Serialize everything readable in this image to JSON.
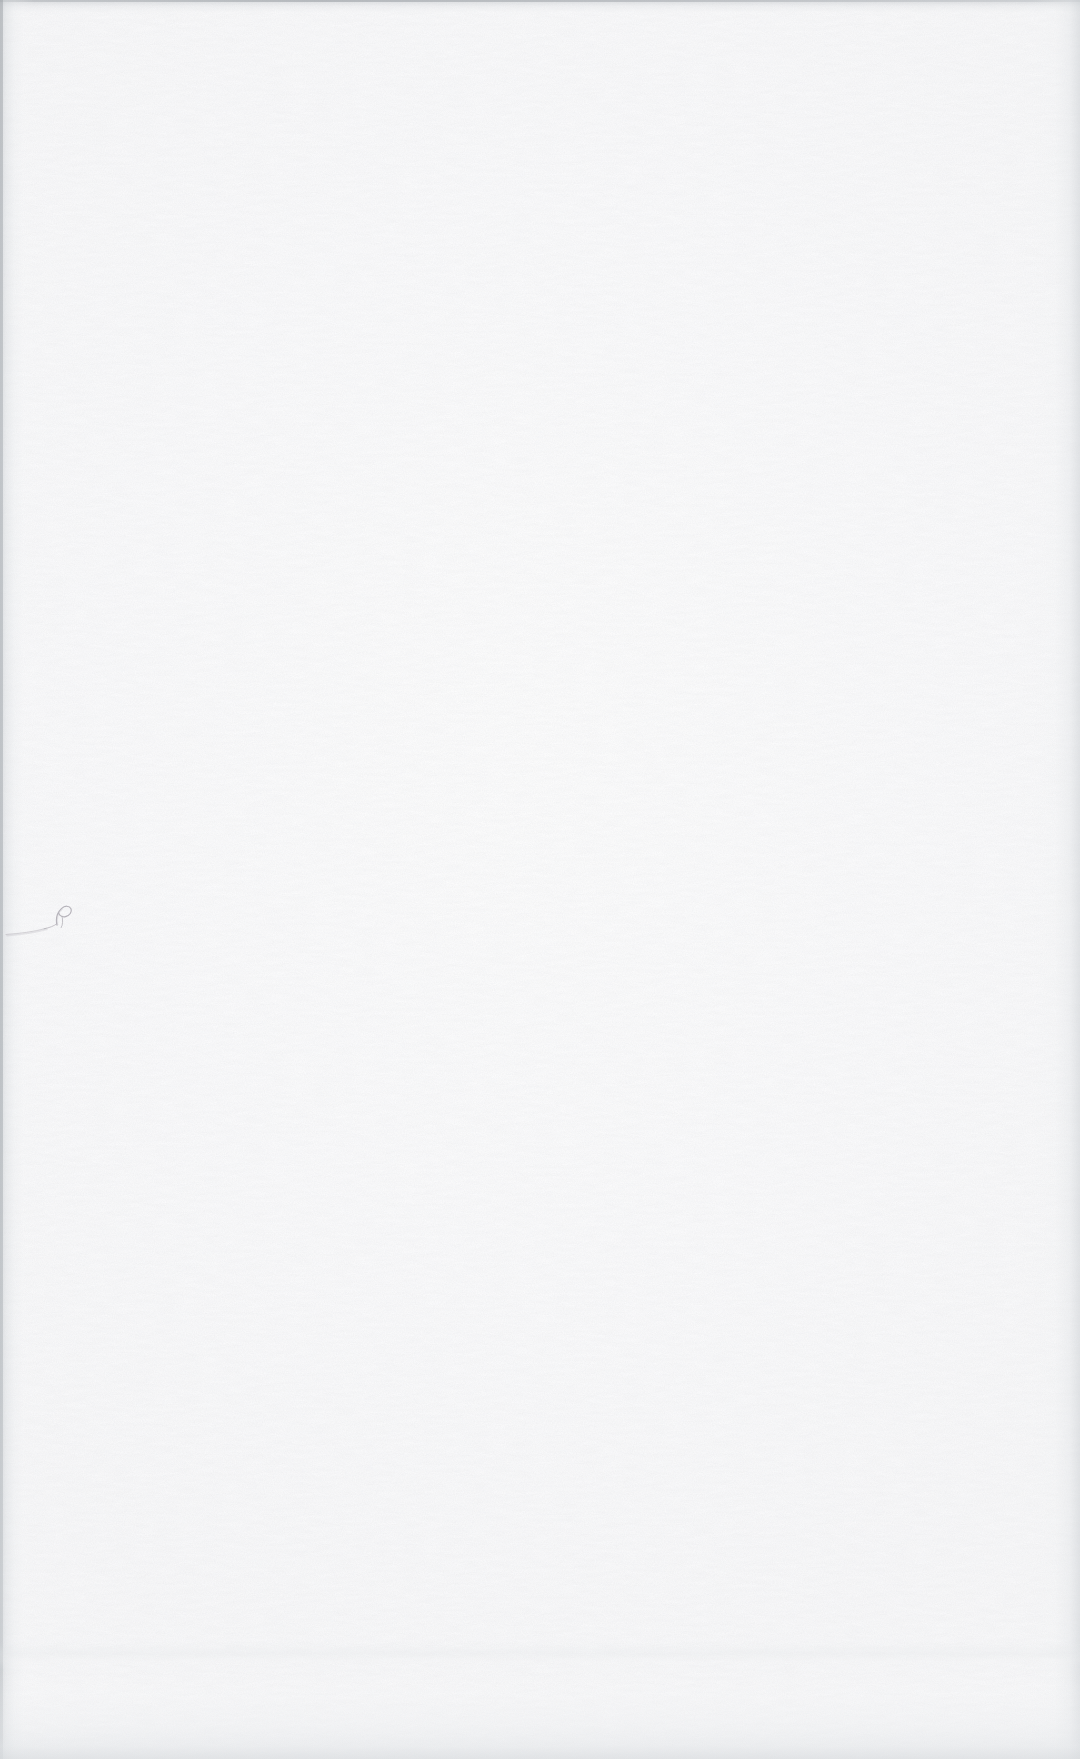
{
  "page": {
    "kind": "scanned-blank-page",
    "width": 1080,
    "height": 1759,
    "caption": "",
    "visible_text": "",
    "paper_color": "#fdfdfd",
    "edge_shadow_color": "#c4c8cc"
  },
  "annotation": {
    "name": "handwritten-pen-mark",
    "transcription": "ℓ",
    "reading": "faint cursive loop resembling a lowercase script l or e, preceded by a long rising pen stroke",
    "ink_color": "#a9a6ae",
    "position": {
      "x": 8,
      "y": 905,
      "width": 64,
      "height": 30
    }
  },
  "edges": {
    "left": {
      "label": "left-scan-edge-shadow",
      "width": 34
    },
    "top": {
      "label": "top-scan-edge-shadow",
      "height": 18
    },
    "right": {
      "label": "right-scan-edge-shadow",
      "width": 48
    },
    "bottom": {
      "label": "bottom-scan-edge-shadow",
      "height": 90
    }
  }
}
